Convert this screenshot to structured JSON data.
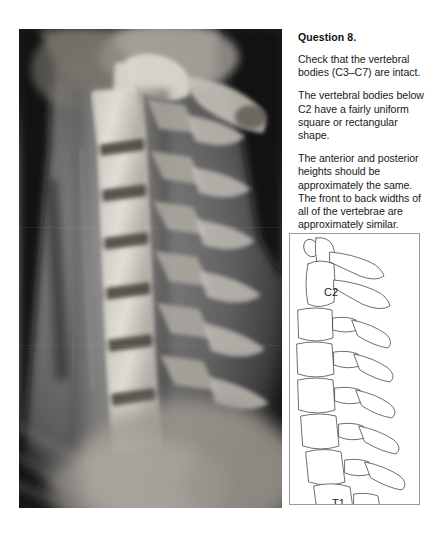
{
  "question": {
    "heading": "Question 8.",
    "paragraphs": [
      "Check that the vertebral bodies (C3–C7) are intact.",
      "The vertebral bodies below C2 have a fairly uniform square or rectangular shape.",
      "The anterior and posterior heights should be approximately the same. The front to back widths of all of the vertebrae are approximately similar."
    ]
  },
  "xray": {
    "name": "lateral-cervical-spine-radiograph",
    "description": "Lateral cervical spine X-ray"
  },
  "diagram": {
    "name": "cervical-spine-line-diagram",
    "labels": [
      {
        "text": "C2",
        "x": 34,
        "y": 62
      },
      {
        "text": "T1",
        "x": 42,
        "y": 237
      }
    ]
  },
  "colors": {
    "page_background": "#ffffff",
    "text": "#1a1a1a",
    "diagram_border": "#9a9a9a",
    "diagram_stroke": "#4a4a4a",
    "xray_dark": "#0a0a0a",
    "xray_bone": "#d8d4cc"
  }
}
